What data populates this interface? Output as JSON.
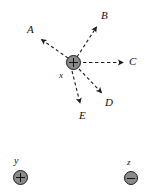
{
  "figure": {
    "background_color": "#ffffff",
    "line_color": "#1c1c1c",
    "charge_fill_color": "#8a8a8a",
    "width": 149,
    "height": 194
  },
  "charges": [
    {
      "id": "x",
      "label": "x",
      "polarity": "positive",
      "sign_glyph": "+",
      "cx": 73.5,
      "cy": 62.5,
      "radius": 7.5,
      "label_x": 59,
      "label_y": 70
    },
    {
      "id": "y",
      "label": "y",
      "polarity": "positive",
      "sign_glyph": "+",
      "cx": 20.5,
      "cy": 177.5,
      "radius": 7.5,
      "label_x": 14,
      "label_y": 156
    },
    {
      "id": "z",
      "label": "z",
      "polarity": "negative",
      "sign_glyph": "-",
      "cx": 131,
      "cy": 178,
      "radius": 7,
      "label_x": 127,
      "label_y": 157
    }
  ],
  "vectors": [
    {
      "id": "A",
      "label": "A",
      "style": "dashed-arrow",
      "from_x": 68,
      "from_y": 58,
      "to_x": 40,
      "to_y": 38,
      "label_x": 27,
      "label_y": 24,
      "direction": "up-left"
    },
    {
      "id": "B",
      "label": "B",
      "style": "dashed-arrow",
      "from_x": 77,
      "from_y": 57,
      "to_x": 98,
      "to_y": 25,
      "label_x": 101,
      "label_y": 10,
      "direction": "up-right"
    },
    {
      "id": "C",
      "label": "C",
      "style": "dashed-arrow",
      "from_x": 83,
      "from_y": 62.5,
      "to_x": 124,
      "to_y": 62.5,
      "label_x": 129,
      "label_y": 56,
      "direction": "right"
    },
    {
      "id": "D",
      "label": "D",
      "style": "dashed-arrow",
      "from_x": 79,
      "from_y": 69,
      "to_x": 103,
      "to_y": 94,
      "label_x": 105,
      "label_y": 97,
      "direction": "down-right"
    },
    {
      "id": "E",
      "label": "E",
      "style": "dashed-arrow",
      "from_x": 72,
      "from_y": 71,
      "to_x": 81,
      "to_y": 105,
      "label_x": 79,
      "label_y": 110,
      "direction": "down"
    }
  ]
}
